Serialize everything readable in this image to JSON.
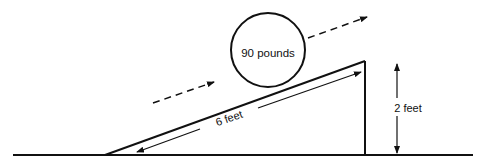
{
  "diagram": {
    "type": "inclined-plane",
    "object": {
      "label": "90 pounds",
      "shape": "circle"
    },
    "ramp_length": {
      "label": "6 feet"
    },
    "ramp_height": {
      "label": "2 feet"
    },
    "motion_arrows": [
      {
        "style": "dashed",
        "direction": "up-slope"
      },
      {
        "style": "dashed",
        "direction": "up-slope"
      }
    ],
    "colors": {
      "ink": "#111111",
      "background": "#ffffff"
    }
  }
}
